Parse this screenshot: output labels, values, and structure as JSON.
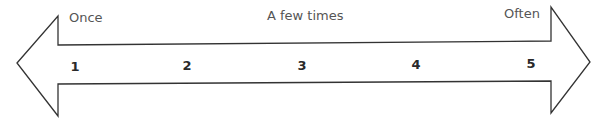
{
  "scale": {
    "labels": {
      "left": "Once",
      "middle": "A few times",
      "right": "Often"
    },
    "points": [
      "1",
      "2",
      "3",
      "4",
      "5"
    ]
  },
  "colors": {
    "stroke": "#333333",
    "label": "#555555",
    "number": "#2a2a2a",
    "background": "#ffffff"
  }
}
